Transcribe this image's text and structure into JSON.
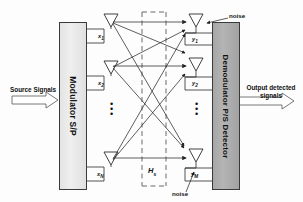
{
  "diagram": {
    "title_type": "mimo-system-block-diagram",
    "transmitter_block": {
      "label": "Modulator S/P",
      "fill": "#e7e7e7",
      "stroke": "#3a3a3a"
    },
    "receiver_block": {
      "label": "Demodulator P/S Detector",
      "fill": "#acacac",
      "stroke": "#3a3a3a"
    },
    "input": {
      "label": "Source Signals"
    },
    "output": {
      "label_line1": "Output detected",
      "label_line2": "signals"
    },
    "channel": {
      "label": "H",
      "subscript": "s",
      "style": "dashed-box"
    },
    "noise": {
      "top_label": "noise",
      "bottom_label": "noise"
    },
    "tx_ports": [
      {
        "label": "x",
        "sub": "1"
      },
      {
        "label": "x",
        "sub": "2"
      },
      {
        "label": "x",
        "sub": "N"
      }
    ],
    "rx_ports": [
      {
        "label": "y",
        "sub": "1"
      },
      {
        "label": "y",
        "sub": "2"
      },
      {
        "label": "y",
        "sub": "M"
      }
    ],
    "ellipsis": {
      "tx": "•••",
      "rx": "•••"
    },
    "colors": {
      "line": "#2a2a2a",
      "dashed": "#6a6a6a",
      "text": "#101010"
    }
  }
}
